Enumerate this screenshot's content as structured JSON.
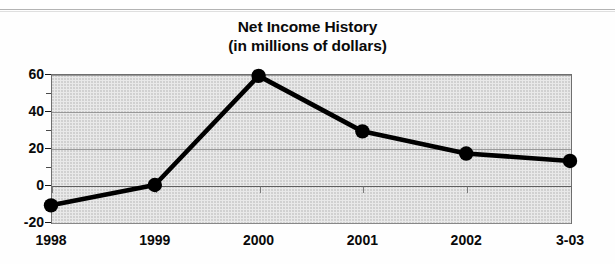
{
  "chart_data": {
    "type": "line",
    "title": "Net Income History",
    "subtitle": "(in millions of dollars)",
    "xlabel": "",
    "ylabel": "",
    "categories": [
      "1998",
      "1999",
      "2000",
      "2001",
      "2002",
      "3-03"
    ],
    "values": [
      -11,
      0,
      59,
      29,
      17,
      13
    ],
    "series": [
      {
        "name": "Net Income",
        "values": [
          -11,
          0,
          59,
          29,
          17,
          13
        ]
      }
    ],
    "ylim": [
      -20,
      60
    ],
    "yticks": [
      60,
      40,
      20,
      0,
      -20
    ],
    "ytick_labels": [
      "60",
      "40",
      "20",
      "0",
      "-20"
    ],
    "yminor_ticks": [
      50,
      30,
      10,
      -10
    ],
    "grid": true,
    "legend": false,
    "legend_position": "none",
    "marker": "filled-circle",
    "line_color": "#000000",
    "marker_color": "#000000",
    "plot_background": "#e9e9e9",
    "figure_background": "#ffffff",
    "units": "millions of dollars"
  },
  "figure": {
    "title_line_1": "Net Income History",
    "title_line_2": "(in millions of dollars)"
  }
}
